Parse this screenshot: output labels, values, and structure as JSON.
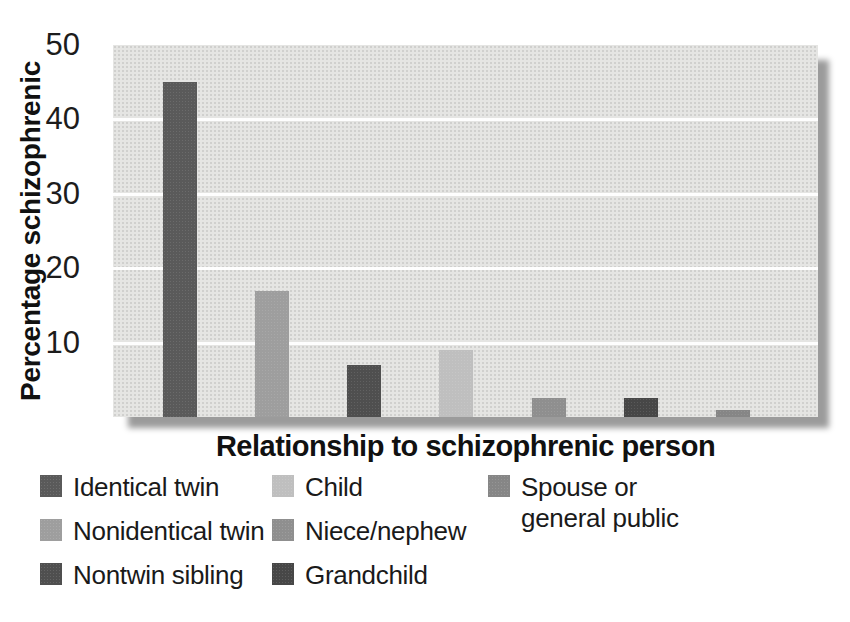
{
  "chart_data": {
    "type": "bar",
    "title": "",
    "xlabel": "Relationship to schizophrenic person",
    "ylabel": "Percentage schizophrenic",
    "ylim": [
      0,
      50
    ],
    "yticks": [
      50,
      40,
      30,
      20,
      10
    ],
    "grid": "horizontal white gridlines at 10, 20, 30, 40",
    "legend_position": "below chart, three columns",
    "categories": [
      "Identical twin",
      "Nonidentical twin",
      "Nontwin sibling",
      "Child",
      "Niece/nephew",
      "Grandchild",
      "Spouse or general public"
    ],
    "values": [
      45,
      17,
      7,
      9,
      2.5,
      2.5,
      1
    ],
    "bar_colors": [
      "#5a5a5a",
      "#9e9e9e",
      "#4f4f4f",
      "#bfbfbf",
      "#8f8f8f",
      "#474747",
      "#868686"
    ],
    "plot_background": "#e5e5e3",
    "gridline_color": "#ffffff",
    "shadow_color": "#9b9b9b"
  },
  "legend": {
    "columns": [
      [
        {
          "label": "Identical twin",
          "color": "#5a5a5a"
        },
        {
          "label": "Nonidentical twin",
          "color": "#9e9e9e"
        },
        {
          "label": "Nontwin sibling",
          "color": "#4f4f4f"
        }
      ],
      [
        {
          "label": "Child",
          "color": "#bfbfbf"
        },
        {
          "label": "Niece/nephew",
          "color": "#8f8f8f"
        },
        {
          "label": "Grandchild",
          "color": "#474747"
        }
      ],
      [
        {
          "label": "Spouse or\ngeneral public",
          "color": "#868686"
        }
      ]
    ]
  }
}
